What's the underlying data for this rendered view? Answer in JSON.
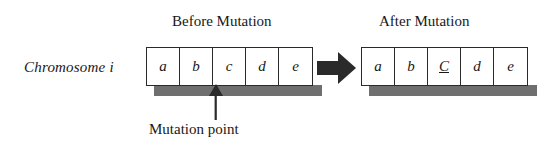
{
  "figure": {
    "row_label": "Chromosome  i",
    "panels": [
      {
        "id": "before",
        "title": "Before Mutation",
        "genes": [
          {
            "label": "a",
            "mutated": false
          },
          {
            "label": "b",
            "mutated": false
          },
          {
            "label": "c",
            "mutated": false
          },
          {
            "label": "d",
            "mutated": false
          },
          {
            "label": "e",
            "mutated": false
          }
        ]
      },
      {
        "id": "after",
        "title": "After Mutation",
        "genes": [
          {
            "label": "a",
            "mutated": false
          },
          {
            "label": "b",
            "mutated": false
          },
          {
            "label": "C",
            "mutated": true
          },
          {
            "label": "d",
            "mutated": false
          },
          {
            "label": "e",
            "mutated": false
          }
        ]
      }
    ],
    "annotation": {
      "mutation_point_label": "Mutation point",
      "points_to_gene": "c"
    },
    "transition_arrow": {
      "icon": "block-right-arrow-icon",
      "direction": "right"
    },
    "colors": {
      "stroke": "#2a2a2a",
      "shadow": "#6f6f6f",
      "arrow": "#2a2a2a",
      "background": "#ffffff",
      "text": "#171717"
    }
  }
}
